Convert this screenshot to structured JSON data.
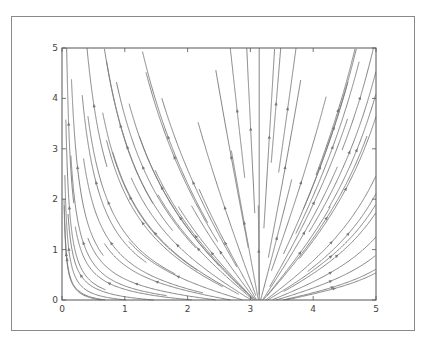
{
  "chart_data": {
    "type": "streamplot",
    "title": "",
    "xlabel": "",
    "ylabel": "",
    "xlim": [
      0,
      5
    ],
    "ylim": [
      0,
      5
    ],
    "grid": false,
    "legend": null,
    "xticks": [
      0,
      1,
      2,
      3,
      4,
      5
    ],
    "yticks": [
      0,
      1,
      2,
      3,
      4,
      5
    ],
    "xtick_labels": [
      "0",
      "1",
      "2",
      "3",
      "4",
      "5"
    ],
    "ytick_labels": [
      "0",
      "1",
      "2",
      "3",
      "4",
      "5"
    ],
    "line_color": "#777777",
    "field": {
      "description": "Vector field diverging horizontally from vertical separatrix at x≈π, flow directed upward",
      "u": "-sin(x)/(y+0.1)",
      "v": "1",
      "separatrix_x": 3.14
    },
    "seeds": [
      [
        0.15,
        0.7
      ],
      [
        0.12,
        1.8
      ],
      [
        0.1,
        3.7
      ],
      [
        0.45,
        4.4
      ],
      [
        0.35,
        1.1
      ],
      [
        0.55,
        2.3
      ],
      [
        0.25,
        2.6
      ],
      [
        0.8,
        1.1
      ],
      [
        0.75,
        1.9
      ],
      [
        0.9,
        3.6
      ],
      [
        1.1,
        2.0
      ],
      [
        1.05,
        3.0
      ],
      [
        1.3,
        1.5
      ],
      [
        1.3,
        2.6
      ],
      [
        1.5,
        1.3
      ],
      [
        1.6,
        2.2
      ],
      [
        1.7,
        3.2
      ],
      [
        1.8,
        2.8
      ],
      [
        1.9,
        1.6
      ],
      [
        2.1,
        2.3
      ],
      [
        2.0,
        0.9
      ],
      [
        2.3,
        1.0
      ],
      [
        2.5,
        0.6
      ],
      [
        2.6,
        1.8
      ],
      [
        2.7,
        2.8
      ],
      [
        2.75,
        4.2
      ],
      [
        2.8,
        0.35
      ],
      [
        2.9,
        0.3
      ],
      [
        2.95,
        1.2
      ],
      [
        3.0,
        3.5
      ],
      [
        0.2,
        0.25
      ],
      [
        0.3,
        0.15
      ],
      [
        0.7,
        0.15
      ],
      [
        1.2,
        0.15
      ],
      [
        1.7,
        0.15
      ],
      [
        2.1,
        0.15
      ],
      [
        2.5,
        0.15
      ],
      [
        2.85,
        0.55
      ],
      [
        3.14,
        0.1
      ],
      [
        3.3,
        0.65
      ],
      [
        3.4,
        0.3
      ],
      [
        3.3,
        3.2
      ],
      [
        3.45,
        4.5
      ],
      [
        3.55,
        2.6
      ],
      [
        3.7,
        1.0
      ],
      [
        3.65,
        4.3
      ],
      [
        3.8,
        2.3
      ],
      [
        3.9,
        0.5
      ],
      [
        4.0,
        1.9
      ],
      [
        4.1,
        2.6
      ],
      [
        4.1,
        0.15
      ],
      [
        4.3,
        0.25
      ],
      [
        4.4,
        1.3
      ],
      [
        4.35,
        3.5
      ],
      [
        4.5,
        4.2
      ],
      [
        4.6,
        2.4
      ],
      [
        4.7,
        0.9
      ],
      [
        4.8,
        1.4
      ],
      [
        4.85,
        3.5
      ],
      [
        4.9,
        4.7
      ],
      [
        4.6,
        3.0
      ],
      [
        4.3,
        3.0
      ],
      [
        4.95,
        2.0
      ],
      [
        4.2,
        1.6
      ],
      [
        4.5,
        0.5
      ]
    ]
  },
  "plot_box": {
    "left": 62,
    "top": 48,
    "right": 376,
    "bottom": 300
  },
  "frame_box": {
    "left": 11,
    "top": 16,
    "width": 404,
    "height": 315
  }
}
